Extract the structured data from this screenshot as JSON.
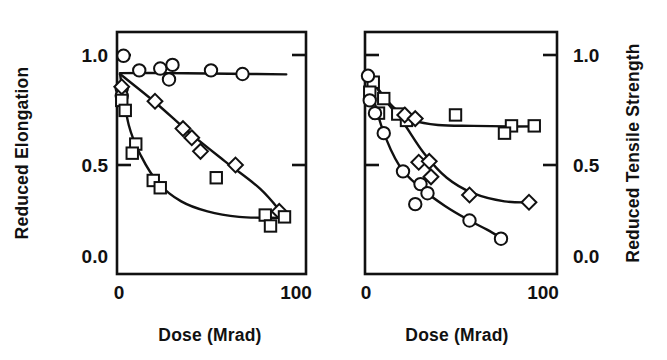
{
  "figure": {
    "background_color": "#ffffff",
    "ink_color": "#111111",
    "panel_count": 2
  },
  "chart_data": [
    {
      "type": "scatter",
      "panel": "left",
      "title": "",
      "xlabel": "Dose (Mrad)",
      "ylabel": "Reduced Elongation",
      "ylabel_side": "left",
      "xlim": [
        0,
        112
      ],
      "ylim": [
        0.0,
        1.12
      ],
      "xticks": [
        0,
        100
      ],
      "xticklabels": [
        "0",
        "100"
      ],
      "yticks": [
        0.0,
        0.5,
        1.0
      ],
      "yticklabels": [
        "0.0",
        "0.5",
        "1.0"
      ],
      "grid": false,
      "legend": "none",
      "frame": "box",
      "tick_direction": "in",
      "series": [
        {
          "name": "circle-series",
          "marker": "circle",
          "points": [
            {
              "x": 2,
              "y": 1.1
            },
            {
              "x": 11,
              "y": 1.02
            },
            {
              "x": 23,
              "y": 1.03
            },
            {
              "x": 30,
              "y": 1.05
            },
            {
              "x": 28,
              "y": 0.97
            },
            {
              "x": 52,
              "y": 1.02
            },
            {
              "x": 70,
              "y": 1.0
            },
            {
              "x": 1,
              "y": 0.92
            },
            {
              "x": 1,
              "y": 0.88
            }
          ],
          "fit_curve": [
            {
              "x": 0,
              "y": 1.005
            },
            {
              "x": 25,
              "y": 1.005
            },
            {
              "x": 50,
              "y": 1.003
            },
            {
              "x": 75,
              "y": 1.0
            },
            {
              "x": 95,
              "y": 0.998
            }
          ]
        },
        {
          "name": "diamond-series",
          "marker": "diamond",
          "points": [
            {
              "x": 1,
              "y": 0.93
            },
            {
              "x": 20,
              "y": 0.85
            },
            {
              "x": 36,
              "y": 0.7
            },
            {
              "x": 41,
              "y": 0.65
            },
            {
              "x": 46,
              "y": 0.575
            },
            {
              "x": 66,
              "y": 0.5
            },
            {
              "x": 91,
              "y": 0.245
            }
          ],
          "fit_curve": [
            {
              "x": 0,
              "y": 1.0
            },
            {
              "x": 20,
              "y": 0.845
            },
            {
              "x": 40,
              "y": 0.675
            },
            {
              "x": 60,
              "y": 0.52
            },
            {
              "x": 80,
              "y": 0.37
            },
            {
              "x": 93,
              "y": 0.23
            }
          ]
        },
        {
          "name": "square-series",
          "marker": "square",
          "points": [
            {
              "x": 1,
              "y": 0.855
            },
            {
              "x": 3,
              "y": 0.8
            },
            {
              "x": 9,
              "y": 0.615
            },
            {
              "x": 7,
              "y": 0.565
            },
            {
              "x": 19,
              "y": 0.415
            },
            {
              "x": 23,
              "y": 0.375
            },
            {
              "x": 55,
              "y": 0.43
            },
            {
              "x": 83,
              "y": 0.225
            },
            {
              "x": 94,
              "y": 0.215
            },
            {
              "x": 86,
              "y": 0.165
            }
          ],
          "fit_curve": [
            {
              "x": 0,
              "y": 1.0
            },
            {
              "x": 5,
              "y": 0.72
            },
            {
              "x": 12,
              "y": 0.55
            },
            {
              "x": 22,
              "y": 0.4
            },
            {
              "x": 35,
              "y": 0.3
            },
            {
              "x": 50,
              "y": 0.245
            },
            {
              "x": 68,
              "y": 0.215
            },
            {
              "x": 86,
              "y": 0.21
            },
            {
              "x": 96,
              "y": 0.21
            }
          ]
        }
      ]
    },
    {
      "type": "scatter",
      "panel": "right",
      "title": "",
      "xlabel": "Dose (Mrad)",
      "ylabel": "Reduced Tensile Strength",
      "ylabel_side": "right",
      "xlim": [
        0,
        112
      ],
      "ylim": [
        0.0,
        1.12
      ],
      "xticks": [
        0,
        100
      ],
      "xticklabels": [
        "0",
        "100"
      ],
      "yticks": [
        0.0,
        0.5,
        1.0
      ],
      "yticklabels": [
        "0.0",
        "0.5",
        "1.0"
      ],
      "grid": false,
      "legend": "none",
      "frame": "box",
      "tick_direction": "in",
      "series": [
        {
          "name": "square-series",
          "marker": "square",
          "points": [
            {
              "x": 3,
              "y": 0.955
            },
            {
              "x": 1,
              "y": 0.9
            },
            {
              "x": 9,
              "y": 0.865
            },
            {
              "x": 6,
              "y": 0.785
            },
            {
              "x": 17,
              "y": 0.78
            },
            {
              "x": 22,
              "y": 0.745
            },
            {
              "x": 50,
              "y": 0.775
            },
            {
              "x": 82,
              "y": 0.715
            },
            {
              "x": 78,
              "y": 0.675
            },
            {
              "x": 95,
              "y": 0.715
            }
          ],
          "fit_curve": [
            {
              "x": 0,
              "y": 1.0
            },
            {
              "x": 8,
              "y": 0.89
            },
            {
              "x": 16,
              "y": 0.805
            },
            {
              "x": 26,
              "y": 0.745
            },
            {
              "x": 40,
              "y": 0.72
            },
            {
              "x": 60,
              "y": 0.715
            },
            {
              "x": 80,
              "y": 0.712
            },
            {
              "x": 97,
              "y": 0.712
            }
          ]
        },
        {
          "name": "diamond-series",
          "marker": "diamond",
          "points": [
            {
              "x": 21,
              "y": 0.775
            },
            {
              "x": 27,
              "y": 0.755
            },
            {
              "x": 29,
              "y": 0.515
            },
            {
              "x": 35,
              "y": 0.52
            },
            {
              "x": 36,
              "y": 0.435
            },
            {
              "x": 58,
              "y": 0.335
            },
            {
              "x": 92,
              "y": 0.295
            }
          ],
          "fit_curve": [
            {
              "x": 0,
              "y": 1.0
            },
            {
              "x": 10,
              "y": 0.855
            },
            {
              "x": 20,
              "y": 0.735
            },
            {
              "x": 32,
              "y": 0.565
            },
            {
              "x": 45,
              "y": 0.43
            },
            {
              "x": 60,
              "y": 0.345
            },
            {
              "x": 78,
              "y": 0.3
            },
            {
              "x": 95,
              "y": 0.295
            }
          ]
        },
        {
          "name": "circle-series",
          "marker": "circle",
          "points": [
            {
              "x": 0,
              "y": 0.99
            },
            {
              "x": 1,
              "y": 0.855
            },
            {
              "x": 4,
              "y": 0.785
            },
            {
              "x": 9,
              "y": 0.675
            },
            {
              "x": 20,
              "y": 0.465
            },
            {
              "x": 30,
              "y": 0.395
            },
            {
              "x": 34,
              "y": 0.345
            },
            {
              "x": 27,
              "y": 0.285
            },
            {
              "x": 58,
              "y": 0.195
            },
            {
              "x": 76,
              "y": 0.095
            }
          ],
          "fit_curve": [
            {
              "x": 0,
              "y": 0.99
            },
            {
              "x": 8,
              "y": 0.705
            },
            {
              "x": 18,
              "y": 0.495
            },
            {
              "x": 30,
              "y": 0.375
            },
            {
              "x": 44,
              "y": 0.275
            },
            {
              "x": 58,
              "y": 0.195
            },
            {
              "x": 68,
              "y": 0.145
            },
            {
              "x": 77,
              "y": 0.095
            }
          ]
        }
      ]
    }
  ],
  "panels": {
    "left": {
      "ylabel": "Reduced Elongation",
      "xlabel": "Dose (Mrad)",
      "ytick_labels": [
        "1.0",
        "0.5",
        "0.0"
      ],
      "xtick_labels": [
        "0",
        "100"
      ]
    },
    "right": {
      "ylabel": "Reduced Tensile Strength",
      "xlabel": "Dose (Mrad)",
      "ytick_labels": [
        "1.0",
        "0.5",
        "0.0"
      ],
      "xtick_labels": [
        "0",
        "100"
      ]
    }
  }
}
